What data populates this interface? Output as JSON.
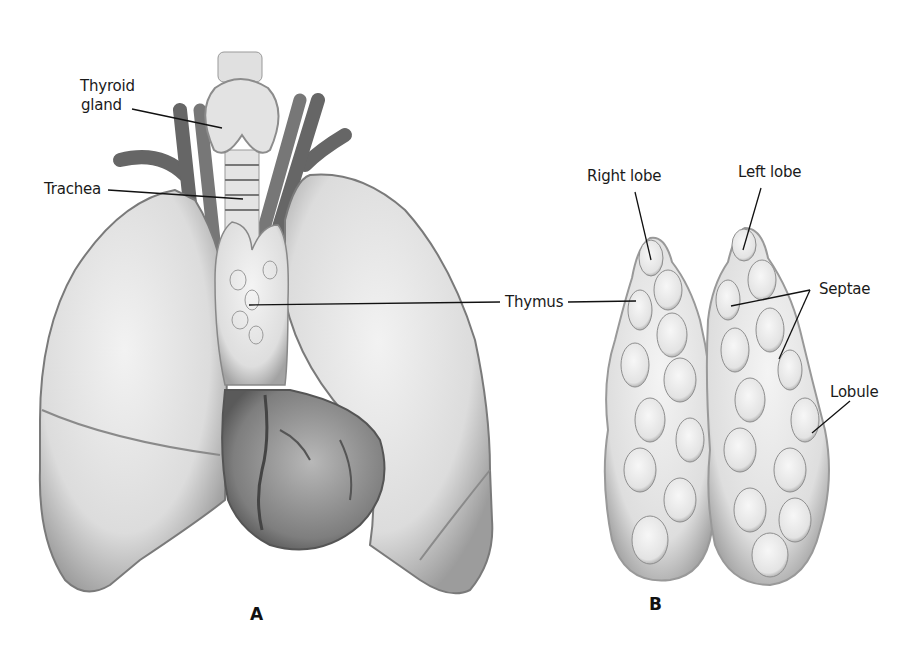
{
  "figure": {
    "panels": [
      {
        "id": "A",
        "letter": "A",
        "description": "Anterior view of chest: lungs, heart, trachea, thyroid gland and thymus",
        "labels": {
          "thyroid_line1": "Thyroid",
          "thyroid_line2": "gland",
          "trachea": "Trachea",
          "thymus": "Thymus"
        }
      },
      {
        "id": "B",
        "letter": "B",
        "description": "Isolated thymus showing lobes, septae and lobules",
        "labels": {
          "right_lobe": "Right lobe",
          "left_lobe": "Left lobe",
          "septae": "Septae",
          "lobule": "Lobule"
        }
      }
    ],
    "colors": {
      "background": "#ffffff",
      "organ_fill": "#e6e6e6",
      "organ_shade": "#9a9a9a",
      "vessel": "#6e6e6e",
      "heart": "#8a8a8a",
      "leader_line": "#111111"
    }
  }
}
